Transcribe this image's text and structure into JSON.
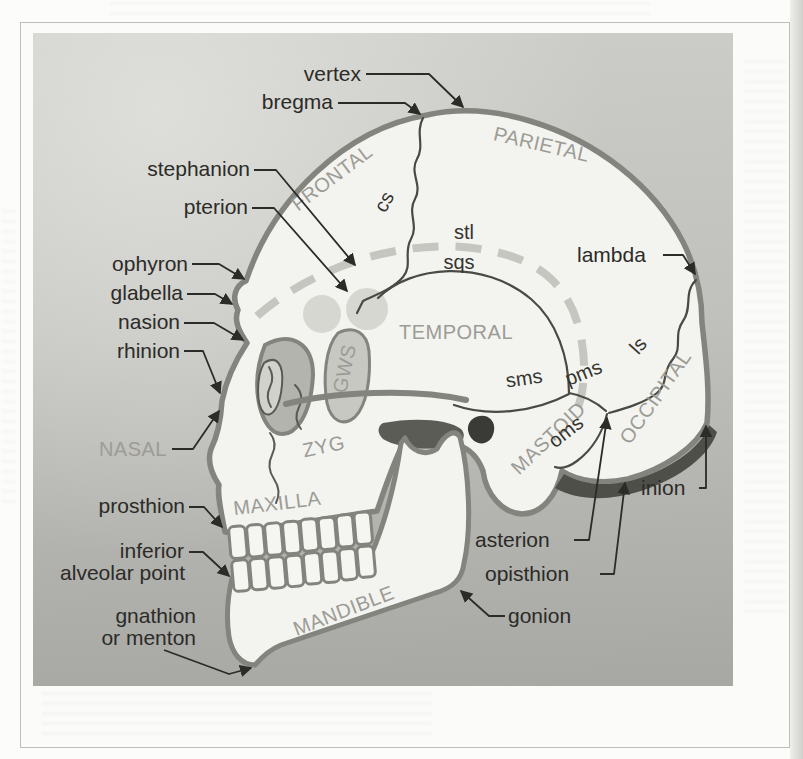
{
  "labels": {
    "landmarks": {
      "vertex": "vertex",
      "bregma": "bregma",
      "stephanion": "stephanion",
      "pterion": "pterion",
      "ophyron": "ophyron",
      "glabella": "glabella",
      "nasion": "nasion",
      "rhinion": "rhinion",
      "prosthion": "prosthion",
      "inferior_alveolar_point": {
        "line1": "inferior",
        "line2": "alveolar point"
      },
      "gnathion": {
        "line1": "gnathion",
        "line2": "or menton"
      },
      "lambda": "lambda",
      "inion": "inion",
      "asterion": "asterion",
      "opisthion": "opisthion",
      "gonion": "gonion"
    },
    "bones": {
      "frontal": "FRONTAL",
      "parietal": "PARIETAL",
      "temporal": "TEMPORAL",
      "occipital": "OCCIPITAL",
      "mastoid": "MASTOID",
      "nasal": "NASAL",
      "zygomatic": "ZYG",
      "maxilla": "MAXILLA",
      "mandible": "MANDIBLE",
      "sphenoid_greater_wing": "GWS"
    },
    "sutures_and_lines": {
      "cs": "cs",
      "stl": "stl",
      "sqs": "sqs",
      "ls": "ls",
      "sms": "sms",
      "pms": "pms",
      "oms": "oms"
    }
  },
  "colors": {
    "panel_top": "#cccccb",
    "panel_bottom": "#a7a7a3",
    "skull_fill": "#f3f3ef",
    "outline": "#84847e",
    "suture_line": "#4a4a45",
    "temporal_line_dashed": "#c6c6c0",
    "dark_shading": "#4f4f4a",
    "ear_canal": "#3a3a36",
    "orbit_fill": "#b4b4ae",
    "gws_fill": "#c8c8c2",
    "pterion_highlight": "#d7d7d1",
    "landmark_text": "#2b2b27",
    "bone_text": "#9c9c96"
  }
}
